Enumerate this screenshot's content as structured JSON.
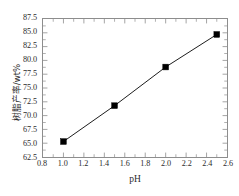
{
  "chart_data": {
    "type": "line",
    "title": "",
    "subtitle": "",
    "xlabel": "pH",
    "ylabel": "树脂产率/wt%",
    "xlim": [
      0.8,
      2.6
    ],
    "ylim": [
      62.5,
      87.5
    ],
    "xticks": [
      0.8,
      1.0,
      1.2,
      1.4,
      1.6,
      1.8,
      2.0,
      2.2,
      2.4,
      2.6
    ],
    "xticklabels": [
      "0.8",
      "1.0",
      "1.2",
      "1.4",
      "1.6",
      "1.8",
      "2.0",
      "2.2",
      "2.4",
      "2.6"
    ],
    "yticks": [
      62.5,
      65.0,
      67.5,
      70.0,
      72.5,
      75.0,
      77.5,
      80.0,
      82.5,
      85.0,
      87.5
    ],
    "yticklabels": [
      "62.5",
      "65.0",
      "67.5",
      "70.0",
      "72.5",
      "75.0",
      "77.5",
      "80.0",
      "82.5",
      "85.0",
      "87.5"
    ],
    "minor_ticks": true,
    "grid": false,
    "legend": null,
    "marker": "filled-square",
    "marker_color": "#000000",
    "line_color": "#000000",
    "frame_color": "#8d8d8d",
    "background_color": "#ffffff",
    "x": [
      1.0,
      1.5,
      2.0,
      2.5
    ],
    "values": [
      65.3,
      71.8,
      78.8,
      84.7
    ],
    "series": [
      {
        "name": "树脂产率",
        "points": [
          {
            "x": 1.0,
            "y": 65.3
          },
          {
            "x": 1.5,
            "y": 71.8
          },
          {
            "x": 2.0,
            "y": 78.8
          },
          {
            "x": 2.5,
            "y": 84.7
          }
        ]
      }
    ]
  }
}
